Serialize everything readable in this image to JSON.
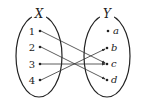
{
  "diagram": {
    "type": "function-mapping",
    "domain_set": {
      "label": "X",
      "elements": [
        "1",
        "2",
        "3",
        "4"
      ]
    },
    "codomain_set": {
      "label": "Y",
      "elements": [
        "a",
        "b",
        "c",
        "d"
      ]
    },
    "mappings": [
      {
        "from": "1",
        "to": "c"
      },
      {
        "from": "2",
        "to": "d"
      },
      {
        "from": "3",
        "to": "c"
      },
      {
        "from": "4",
        "to": "b"
      }
    ],
    "colors": {
      "stroke": "#222222",
      "arrow": "#333333"
    }
  }
}
